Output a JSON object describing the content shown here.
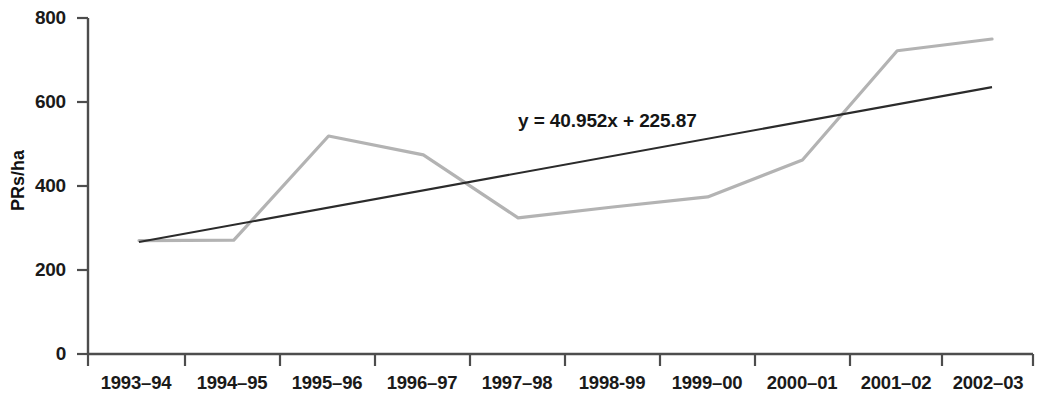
{
  "chart_data": {
    "type": "line",
    "title": "",
    "xlabel": "",
    "ylabel": "PRs/ha",
    "categories": [
      "1993–94",
      "1994–95",
      "1995–96",
      "1996–97",
      "1997–98",
      "1998-99",
      "1999–00",
      "2000–01",
      "2001–02",
      "2002–03"
    ],
    "series": [
      {
        "name": "PRs/ha",
        "color": "#b3b3b3",
        "values": [
          270,
          271,
          519,
          474,
          324,
          350,
          374,
          462,
          722,
          750
        ]
      },
      {
        "name": "Linear trend",
        "color": "#2b2b2b",
        "type": "line",
        "equation": "y = 40.952x + 225.87",
        "slope": 40.952,
        "intercept": 225.87,
        "values": [
          266.8,
          307.8,
          348.7,
          389.7,
          430.6,
          471.6,
          512.5,
          553.5,
          594.4,
          635.4
        ]
      }
    ],
    "yticks": [
      0,
      200,
      400,
      600,
      800
    ],
    "ytick_labels": [
      "0",
      "200",
      "400",
      "600",
      "800"
    ],
    "ylim": [
      0,
      800
    ],
    "grid": false,
    "legend": false,
    "annotations": [
      {
        "name": "trend-equation",
        "text": "y = 40.952x + 225.87"
      }
    ]
  },
  "axes": {
    "y_title": "PRs/ha"
  }
}
